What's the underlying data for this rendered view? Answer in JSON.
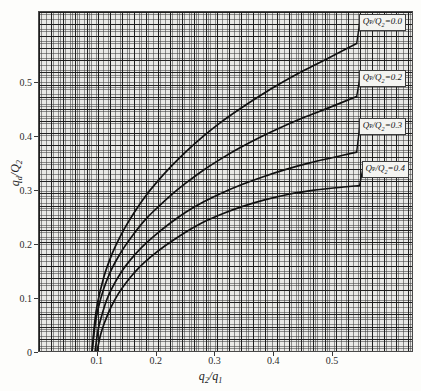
{
  "chart_data": {
    "type": "line",
    "title": "",
    "xlabel": "q2/q1",
    "ylabel": "qd/Q2",
    "xlim": [
      0.0,
      0.6375
    ],
    "ylim": [
      0.0,
      0.6315
    ],
    "xticks": [
      "0.1",
      "0.2",
      "0.3",
      "0.4",
      "0.5"
    ],
    "xtick_values": [
      0.1,
      0.2,
      0.3,
      0.4,
      0.5
    ],
    "yticks": [
      "0",
      "0.1",
      "0.2",
      "0.3",
      "0.4",
      "0.5"
    ],
    "ytick_values": [
      0.0,
      0.1,
      0.2,
      0.3,
      0.4,
      0.5
    ],
    "origin_label": "0",
    "grid": "minor and major grid, log-style fine mesh, both axes",
    "legend_position": "inline callout boxes at right end of each curve",
    "series": [
      {
        "name": "QP/Q2=0.0",
        "label_html": "<i>Q</i><span class=\"romansub\">P</span>/<i>Q</i><sub>2</sub>=0.0",
        "x": [
          0.09,
          0.095,
          0.1,
          0.11,
          0.12,
          0.13,
          0.145,
          0.16,
          0.18,
          0.2,
          0.225,
          0.25,
          0.28,
          0.31,
          0.34,
          0.375,
          0.41,
          0.45,
          0.49,
          0.54
        ],
        "y": [
          0.0,
          0.06,
          0.095,
          0.14,
          0.172,
          0.198,
          0.23,
          0.257,
          0.289,
          0.316,
          0.346,
          0.373,
          0.402,
          0.428,
          0.451,
          0.476,
          0.499,
          0.523,
          0.545,
          0.573
        ]
      },
      {
        "name": "QP/Q2=0.2",
        "label_html": "<i>Q</i><span class=\"romansub\">P</span>/<i>Q</i><sub>2</sub>=0.2",
        "x": [
          0.09,
          0.095,
          0.1,
          0.11,
          0.12,
          0.13,
          0.145,
          0.16,
          0.18,
          0.2,
          0.225,
          0.25,
          0.28,
          0.31,
          0.34,
          0.375,
          0.41,
          0.45,
          0.49,
          0.54
        ],
        "y": [
          0.0,
          0.05,
          0.08,
          0.119,
          0.147,
          0.169,
          0.196,
          0.219,
          0.246,
          0.268,
          0.293,
          0.315,
          0.339,
          0.36,
          0.379,
          0.399,
          0.417,
          0.436,
          0.453,
          0.475
        ]
      },
      {
        "name": "QP/Q2=0.3",
        "label_html": "<i>Q</i><span class=\"romansub\">P</span>/<i>Q</i><sub>2</sub>=0.3",
        "x": [
          0.095,
          0.1,
          0.105,
          0.115,
          0.125,
          0.14,
          0.155,
          0.175,
          0.195,
          0.22,
          0.25,
          0.28,
          0.31,
          0.345,
          0.38,
          0.42,
          0.46,
          0.5,
          0.54
        ],
        "y": [
          0.0,
          0.04,
          0.063,
          0.098,
          0.122,
          0.15,
          0.172,
          0.196,
          0.216,
          0.238,
          0.261,
          0.28,
          0.296,
          0.312,
          0.326,
          0.34,
          0.352,
          0.362,
          0.372
        ]
      },
      {
        "name": "QP/Q2=0.4",
        "label_html": "<i>Q</i><span class=\"romansub\">P</span>/<i>Q</i><sub>2</sub>=0.4",
        "x": [
          0.098,
          0.105,
          0.112,
          0.122,
          0.135,
          0.15,
          0.17,
          0.19,
          0.215,
          0.245,
          0.275,
          0.31,
          0.345,
          0.385,
          0.425,
          0.465,
          0.505,
          0.545
        ],
        "y": [
          0.0,
          0.035,
          0.058,
          0.084,
          0.11,
          0.133,
          0.158,
          0.178,
          0.199,
          0.221,
          0.24,
          0.257,
          0.271,
          0.284,
          0.294,
          0.301,
          0.306,
          0.31
        ]
      }
    ]
  },
  "axes": {
    "x_title_html": "<i>q</i><sub>2</sub>/<i>q</i><sub>1</sub>",
    "y_title_html": "<i>q</i><sub>d</sub>/<i>Q</i><sub>2</sub>"
  },
  "colors": {
    "curve": "#111111",
    "plot_background": "#e9e9e6",
    "grid_minor": "#3c3c3c",
    "grid_major": "#191919",
    "frame": "#4a4a4a",
    "label_box_background": "#f4f4f1",
    "text": "#2b2b2b"
  }
}
